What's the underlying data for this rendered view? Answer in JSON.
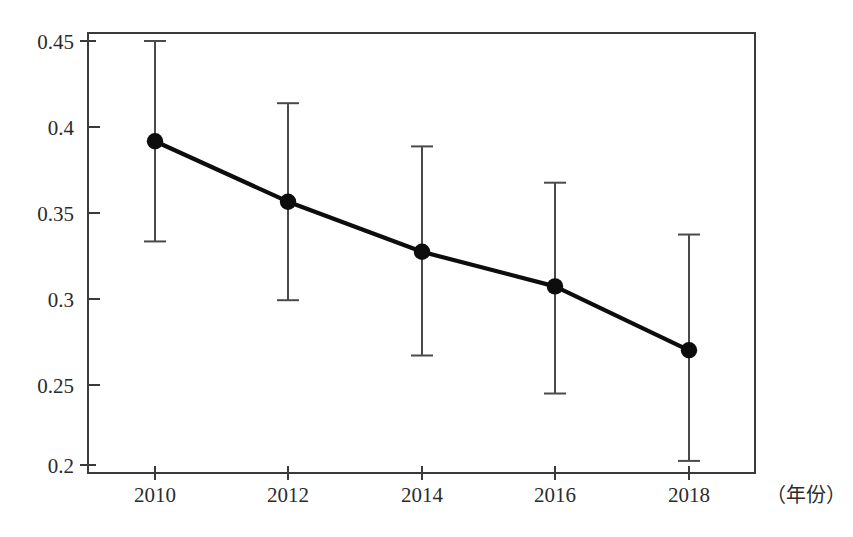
{
  "chart_data": {
    "type": "line",
    "title": "",
    "subtitle": "",
    "xlabel": "（年份）",
    "ylabel": "",
    "x": [
      2010,
      2012,
      2014,
      2016,
      2018
    ],
    "categories": [
      "2010",
      "2012",
      "2014",
      "2016",
      "2018"
    ],
    "xtick_labels": [
      "2010",
      "2012",
      "2014",
      "2016",
      "2018"
    ],
    "ytick_labels": [
      "0.45",
      "0.4",
      "0.35",
      "0.3",
      "0.25",
      "0.2"
    ],
    "yticks": [
      0.45,
      0.4,
      0.35,
      0.3,
      0.25,
      0.2
    ],
    "ylim": [
      0.2,
      0.4525
    ],
    "xlim": [
      2009.0,
      2019.0
    ],
    "grid": false,
    "legend": null,
    "marker": "filled-circle",
    "errorbars": true,
    "series": [
      {
        "name": "value",
        "values": [
          0.392,
          0.357,
          0.328,
          0.308,
          0.271
        ],
        "err_low": [
          0.334,
          0.3,
          0.268,
          0.246,
          0.207
        ],
        "err_high": [
          0.45,
          0.414,
          0.389,
          0.368,
          0.338
        ]
      }
    ],
    "points": [
      {
        "x": "2010",
        "y": 0.392,
        "low": 0.334,
        "high": 0.45
      },
      {
        "x": "2012",
        "y": 0.357,
        "low": 0.3,
        "high": 0.414
      },
      {
        "x": "2014",
        "y": 0.328,
        "low": 0.268,
        "high": 0.389
      },
      {
        "x": "2016",
        "y": 0.308,
        "low": 0.246,
        "high": 0.368
      },
      {
        "x": "2018",
        "y": 0.271,
        "low": 0.207,
        "high": 0.338
      }
    ],
    "colors": {
      "line": "#0d0d0d",
      "marker": "#0d0d0d",
      "errorbar": "#4a4a4a",
      "axis": "#3a3a3a",
      "background": "#ffffff",
      "text": "#2b2b2b"
    }
  },
  "axis": {
    "y_labels": [
      "0.45",
      "0.4",
      "0.35",
      "0.3",
      "0.25",
      "0.2"
    ],
    "x_labels": [
      "2010",
      "2012",
      "2014",
      "2016",
      "2018"
    ],
    "x_caption": "（年份）"
  }
}
